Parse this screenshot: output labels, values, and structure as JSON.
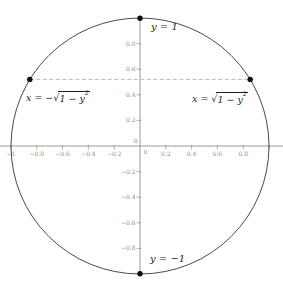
{
  "figure": {
    "background": "#ffffff",
    "circle_color": "#4a4a4a",
    "axis_color": "#8f8f8f",
    "tick_color": "#999999",
    "tick_label_color": "#8c8c8c",
    "label_color": "#1f1f1f",
    "chord_color": "#b4b4b4",
    "point_color": "#111111"
  },
  "labels": {
    "top_point": "y = 1",
    "bottom_point": "y = −1",
    "left_eq": {
      "prefix": "x = −",
      "radical": "√",
      "radicand": "1 − y",
      "exponent": "2"
    },
    "right_eq": {
      "prefix": "x = ",
      "radical": "√",
      "radicand": "1 − y",
      "exponent": "2"
    }
  },
  "axes": {
    "x_ticks": [
      {
        "v": -1,
        "label": "−1"
      },
      {
        "v": -0.8,
        "label": "−0.8"
      },
      {
        "v": -0.6,
        "label": "−0.6"
      },
      {
        "v": -0.4,
        "label": "−0.4"
      },
      {
        "v": -0.2,
        "label": "−0.2"
      },
      {
        "v": 0.2,
        "label": "0.2"
      },
      {
        "v": 0.4,
        "label": "0.4"
      },
      {
        "v": 0.6,
        "label": "0.6"
      },
      {
        "v": 0.8,
        "label": "0.8"
      },
      {
        "v": 1,
        "label": ""
      }
    ],
    "y_ticks": [
      {
        "v": 0.8,
        "label": "0.8"
      },
      {
        "v": 0.6,
        "label": "0.6"
      },
      {
        "v": 0.4,
        "label": "0.4"
      },
      {
        "v": 0.2,
        "label": "0.2"
      },
      {
        "v": -0.2,
        "label": "−0.2"
      },
      {
        "v": -0.4,
        "label": "−0.4"
      },
      {
        "v": -0.6,
        "label": "−0.6"
      },
      {
        "v": -0.8,
        "label": "−0.8"
      }
    ],
    "origin_x_label": "0",
    "origin_y_label": "0"
  },
  "chart_data": {
    "type": "line",
    "title": "",
    "xlabel": "",
    "ylabel": "",
    "grid": false,
    "xlim": [
      -1.09,
      1.11
    ],
    "ylim": [
      -1.1,
      1.14
    ],
    "x_ticks": [
      -1,
      -0.8,
      -0.6,
      -0.4,
      -0.2,
      0,
      0.2,
      0.4,
      0.6,
      0.8
    ],
    "y_ticks": [
      -0.8,
      -0.6,
      -0.4,
      -0.2,
      0,
      0.2,
      0.4,
      0.6,
      0.8
    ],
    "curve": {
      "name": "unit circle",
      "equation": "x² + y² = 1",
      "center": [
        0,
        0
      ],
      "radius": 1
    },
    "annotated_points": [
      {
        "x": 0,
        "y": 1,
        "label": "y = 1"
      },
      {
        "x": 0,
        "y": -1,
        "label": "y = −1"
      },
      {
        "x": -0.854,
        "y": 0.52,
        "label": "x = −√(1 − y²)"
      },
      {
        "x": 0.854,
        "y": 0.52,
        "label": "x = √(1 − y²)"
      }
    ],
    "chord": {
      "y": 0.52,
      "from_x": -0.854,
      "to_x": 0.854,
      "style": "dashed"
    }
  }
}
